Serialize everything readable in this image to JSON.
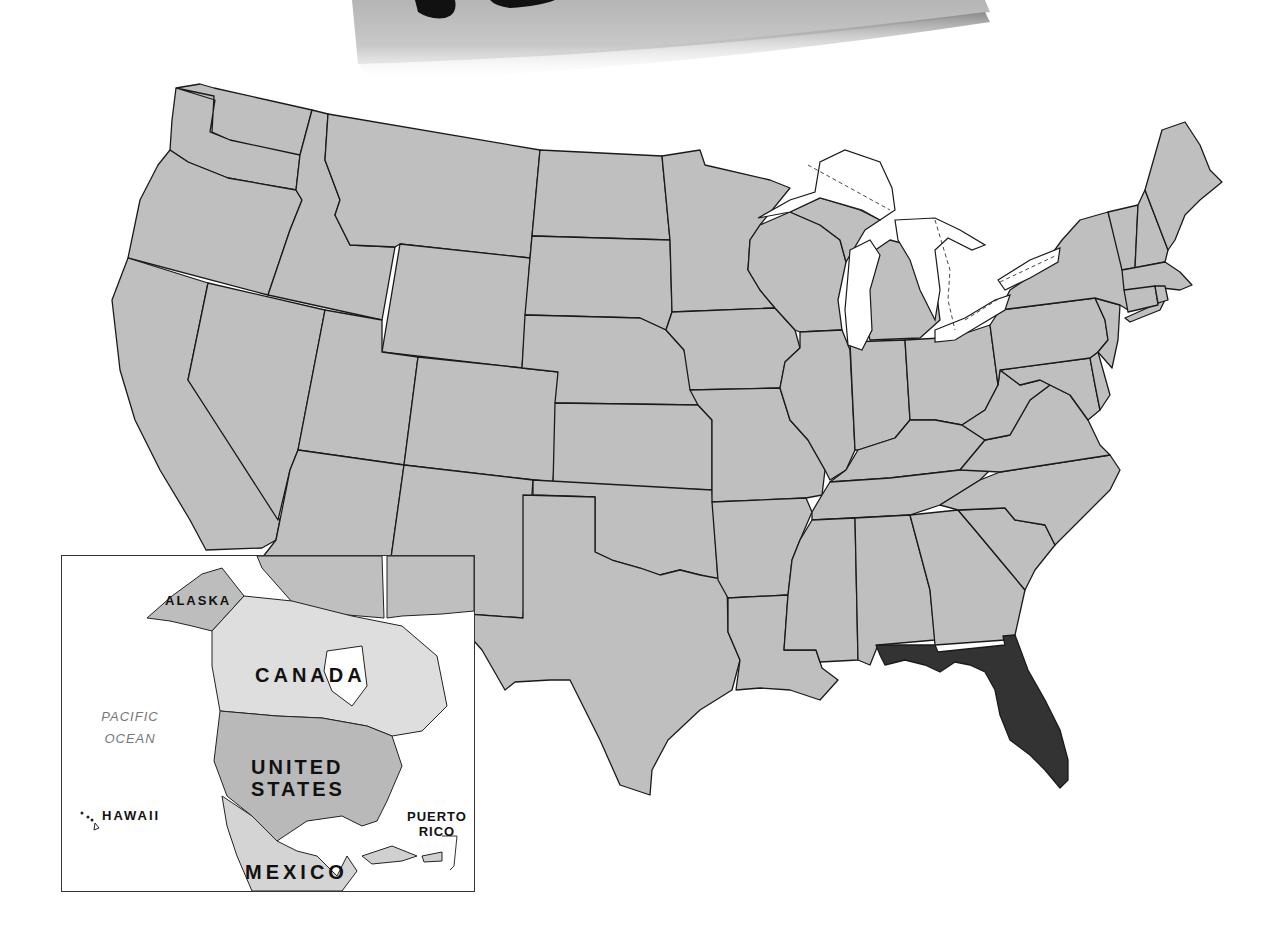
{
  "map": {
    "title": "United States",
    "highlighted_state": "Florida",
    "colors": {
      "state_fill": "#bfbfbf",
      "highlight_fill": "#333333",
      "border": "#1a1a1a",
      "water": "#ffffff",
      "canada_fill": "#dcdcdc",
      "mexico_fill": "#d4d4d4",
      "us_inset_fill": "#b8b8b8"
    },
    "states": [
      "Washington",
      "Oregon",
      "California",
      "Idaho",
      "Nevada",
      "Montana",
      "Wyoming",
      "Utah",
      "Arizona",
      "Colorado",
      "New Mexico",
      "North Dakota",
      "South Dakota",
      "Nebraska",
      "Kansas",
      "Oklahoma",
      "Texas",
      "Minnesota",
      "Iowa",
      "Missouri",
      "Arkansas",
      "Louisiana",
      "Wisconsin",
      "Illinois",
      "Michigan",
      "Indiana",
      "Ohio",
      "Kentucky",
      "Tennessee",
      "Mississippi",
      "Alabama",
      "Georgia",
      "Florida",
      "South Carolina",
      "North Carolina",
      "Virginia",
      "West Virginia",
      "Maryland",
      "Delaware",
      "Pennsylvania",
      "New Jersey",
      "New York",
      "Connecticut",
      "Rhode Island",
      "Massachusetts",
      "Vermont",
      "New Hampshire",
      "Maine"
    ]
  },
  "inset": {
    "labels": {
      "alaska": "ALASKA",
      "canada": "CANADA",
      "united_states_line1": "UNITED",
      "united_states_line2": "STATES",
      "mexico": "MEXICO",
      "hawaii": "HAWAII",
      "puerto_rico_line1": "PUERTO",
      "puerto_rico_line2": "RICO",
      "pacific_line1": "PACIFIC",
      "pacific_line2": "OCEAN"
    }
  }
}
